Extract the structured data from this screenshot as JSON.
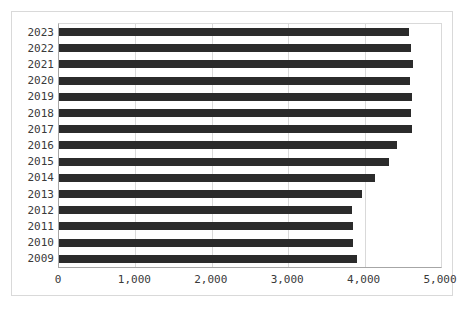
{
  "chart_data": {
    "type": "bar",
    "orientation": "horizontal",
    "title": "",
    "xlabel": "",
    "ylabel": "",
    "grid": true,
    "legend": false,
    "xlim": [
      0,
      5000
    ],
    "xticks": [
      "0",
      "1,000",
      "2,000",
      "3,000",
      "4,000",
      "5,000"
    ],
    "xtick_values": [
      0,
      1000,
      2000,
      3000,
      4000,
      5000
    ],
    "categories": [
      "2023",
      "2022",
      "2021",
      "2020",
      "2019",
      "2018",
      "2017",
      "2016",
      "2015",
      "2014",
      "2013",
      "2012",
      "2011",
      "2010",
      "2009"
    ],
    "values": [
      4580,
      4610,
      4640,
      4600,
      4625,
      4610,
      4625,
      4420,
      4320,
      4140,
      3970,
      3835,
      3850,
      3850,
      3900
    ],
    "bar_color": "#2b2b2b",
    "grid_color": "#d9d9d9",
    "axis_color": "#a6a6a6"
  }
}
